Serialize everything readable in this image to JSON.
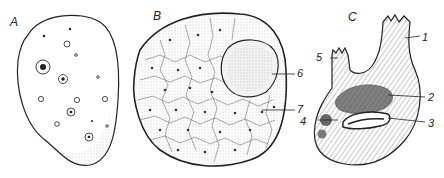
{
  "figure": {
    "panels": [
      {
        "id": "A",
        "label": "A",
        "description": "oval cell with scattered small circles and star-like nuclei"
      },
      {
        "id": "B",
        "label": "B",
        "description": "round body composed of polygonal cells with a large oval inclusion"
      },
      {
        "id": "C",
        "label": "C",
        "description": "flask-shaped organism with two siphon-like projections"
      }
    ],
    "callouts": [
      {
        "number": "1",
        "panel": "C"
      },
      {
        "number": "2",
        "panel": "C"
      },
      {
        "number": "3",
        "panel": "C"
      },
      {
        "number": "4",
        "panel": "C"
      },
      {
        "number": "5",
        "panel": "C"
      },
      {
        "number": "6",
        "panel": "B"
      },
      {
        "number": "7",
        "panel": "B"
      }
    ],
    "colors": {
      "ink": "#222222",
      "background": "#ffffff",
      "stipple": "#888888"
    }
  }
}
